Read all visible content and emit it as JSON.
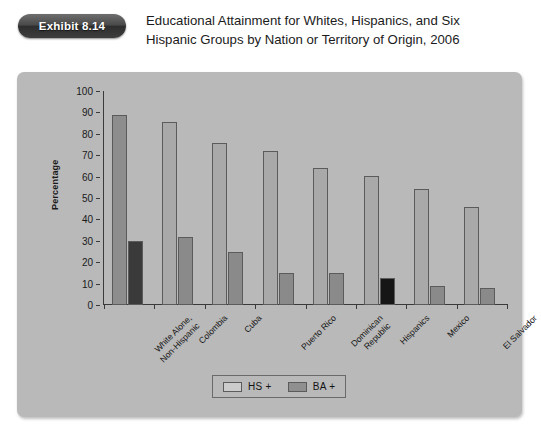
{
  "exhibit": {
    "badge_label": "Exhibit 8.14",
    "title_line_1": "Educational Attainment for Whites, Hispanics, and Six",
    "title_line_2": "Hispanic Groups by Nation or Territory of Origin, 2006"
  },
  "legend": {
    "series_1_label": "HS +",
    "series_2_label": "BA +"
  },
  "colors": {
    "panel_background": "#b9b9b9",
    "page_background": "#ffffff",
    "hs_bar": "#a9a9a9",
    "ba_bar": "#8a8a8a",
    "ba_bar_dark": "#3a3a3a",
    "axis": "#3a3a3a",
    "badge": "#3d3d3d",
    "text": "#1a1a1a"
  },
  "chart_data": {
    "type": "bar",
    "title": "Educational Attainment for Whites, Hispanics, and Six Hispanic Groups by Nation or Territory of Origin, 2006",
    "xlabel": "",
    "ylabel": "Percentage",
    "ylim": [
      0,
      100
    ],
    "ytick_values": [
      0,
      10,
      20,
      30,
      40,
      50,
      60,
      70,
      80,
      90,
      100
    ],
    "ytick_labels": [
      "0",
      "10",
      "20",
      "30",
      "40",
      "50",
      "60",
      "70",
      "80",
      "90",
      "100"
    ],
    "grid": false,
    "legend_position": "bottom-center",
    "categories": [
      "White Alone,\nNon-Hispanic",
      "Colombia",
      "Cuba",
      "Puerto Rico",
      "Dominican\nRepublic",
      "Hispanics",
      "Mexico",
      "El Salvador"
    ],
    "series": [
      {
        "name": "HS +",
        "values": [
          89,
          85.5,
          75.5,
          72,
          64,
          60.5,
          54,
          46
        ]
      },
      {
        "name": "BA +",
        "values": [
          30,
          32,
          25,
          15,
          15,
          12.5,
          9,
          8
        ]
      }
    ]
  }
}
